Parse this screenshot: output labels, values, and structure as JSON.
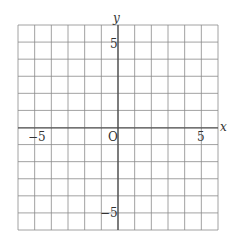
{
  "chart_data": {
    "type": "coordinate-grid",
    "title": "",
    "xlabel": "x",
    "ylabel": "y",
    "origin_label": "O",
    "xlim": [
      -6,
      6
    ],
    "ylim": [
      -6,
      6
    ],
    "grid": true,
    "grid_step": 1,
    "tick_labels": {
      "x": [
        {
          "value": -5,
          "label": "−5"
        },
        {
          "value": 5,
          "label": "5"
        }
      ],
      "y": [
        {
          "value": 5,
          "label": "5"
        },
        {
          "value": -5,
          "label": "−5"
        }
      ]
    },
    "series": []
  },
  "colors": {
    "grid": "#8a8a8a",
    "axis": "#444444",
    "text": "#333333",
    "background": "#ffffff"
  },
  "labels": {
    "x_axis": "x",
    "y_axis": "y",
    "origin": "O",
    "x_neg5": "−5",
    "x_pos5": "5",
    "y_pos5": "5",
    "y_neg5": "−5"
  }
}
